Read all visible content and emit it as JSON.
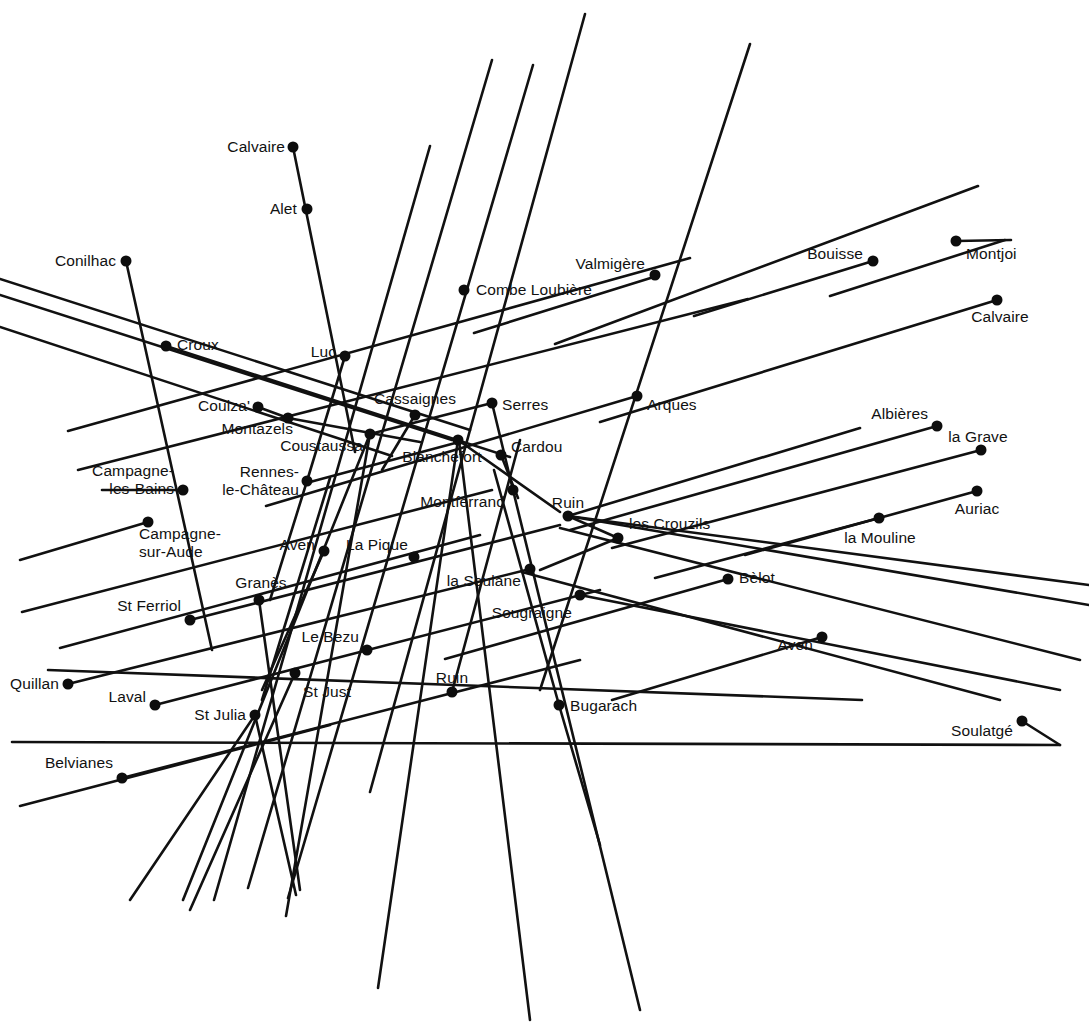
{
  "figure": {
    "type": "alignment-map",
    "width": 1089,
    "height": 1036,
    "background_color": "#ffffff",
    "line_color": "#111111",
    "dot_color": "#0d0d0d",
    "line_width": 2.6,
    "dot_radius": 5.5
  },
  "sites": [
    {
      "name": "Calvaire",
      "x": 293,
      "y": 147,
      "lx": 285,
      "ly": 147,
      "anchor": "r",
      "lines": [
        "Calvaire"
      ]
    },
    {
      "name": "Alet",
      "x": 307,
      "y": 209,
      "lx": 297,
      "ly": 209,
      "anchor": "r",
      "lines": [
        "Alet"
      ]
    },
    {
      "name": "Conilhac",
      "x": 126,
      "y": 261,
      "lx": 116,
      "ly": 261,
      "anchor": "r",
      "lines": [
        "Conilhac"
      ]
    },
    {
      "name": "Combe Loubiere",
      "x": 464,
      "y": 290,
      "lx": 476,
      "ly": 290,
      "anchor": "l",
      "lines": [
        "Combe Loubière"
      ]
    },
    {
      "name": "Valmigere",
      "x": 655,
      "y": 275,
      "lx": 645,
      "ly": 264,
      "anchor": "r",
      "lines": [
        "Valmigère"
      ]
    },
    {
      "name": "Bouisse",
      "x": 873,
      "y": 261,
      "lx": 863,
      "ly": 254,
      "anchor": "r",
      "lines": [
        "Bouisse"
      ]
    },
    {
      "name": "Montjoi",
      "x": 956,
      "y": 241,
      "lx": 966,
      "ly": 254,
      "anchor": "l",
      "lines": [
        "Montjoi"
      ]
    },
    {
      "name": "Calvaire-est",
      "x": 997,
      "y": 300,
      "lx": 1000,
      "ly": 317,
      "anchor": "c",
      "lines": [
        "Calvaire"
      ]
    },
    {
      "name": "Croux",
      "x": 166,
      "y": 346,
      "lx": 177,
      "ly": 345,
      "anchor": "l",
      "lines": [
        "Croux"
      ]
    },
    {
      "name": "Luc",
      "x": 345,
      "y": 356,
      "lx": 336,
      "ly": 352,
      "anchor": "r",
      "lines": [
        "Luc"
      ]
    },
    {
      "name": "Cassaignes",
      "x": 415,
      "y": 415,
      "lx": 415,
      "ly": 399,
      "anchor": "c",
      "lines": [
        "Cassaignes"
      ]
    },
    {
      "name": "Serres",
      "x": 492,
      "y": 403,
      "lx": 502,
      "ly": 405,
      "anchor": "l",
      "lines": [
        "Serres"
      ]
    },
    {
      "name": "Arques",
      "x": 637,
      "y": 396,
      "lx": 647,
      "ly": 405,
      "anchor": "l",
      "lines": [
        "Arques"
      ]
    },
    {
      "name": "Couiza",
      "x": 258,
      "y": 407,
      "lx": 250,
      "ly": 406,
      "anchor": "r",
      "lines": [
        "Couiza'"
      ]
    },
    {
      "name": "Montazels",
      "x": 288,
      "y": 418,
      "lx": 293,
      "ly": 429,
      "anchor": "r",
      "lines": [
        "Montazels"
      ]
    },
    {
      "name": "Coustaussa",
      "x": 370,
      "y": 434,
      "lx": 363,
      "ly": 446,
      "anchor": "r",
      "lines": [
        "Coustaussa"
      ]
    },
    {
      "name": "Blanchefort",
      "x": 458,
      "y": 440,
      "lx": 442,
      "ly": 457,
      "anchor": "c",
      "lines": [
        "Blanchefort"
      ]
    },
    {
      "name": "Cardou",
      "x": 501,
      "y": 455,
      "lx": 511,
      "ly": 447,
      "anchor": "l",
      "lines": [
        "Cardou"
      ]
    },
    {
      "name": "Albieres",
      "x": 937,
      "y": 426,
      "lx": 928,
      "ly": 414,
      "anchor": "r",
      "lines": [
        "Albières"
      ]
    },
    {
      "name": "la Grave",
      "x": 981,
      "y": 450,
      "lx": 978,
      "ly": 437,
      "anchor": "c",
      "lines": [
        "la Grave"
      ]
    },
    {
      "name": "Rennes-le-Chateau",
      "x": 307,
      "y": 481,
      "lx": 299,
      "ly": 481,
      "anchor": "r",
      "lines": [
        "Rennes-",
        "le-Château"
      ]
    },
    {
      "name": "Campagne-les-Bains",
      "x": 183,
      "y": 490,
      "lx": 174,
      "ly": 480,
      "anchor": "r",
      "lines": [
        "Campagne-",
        "les-Bains"
      ]
    },
    {
      "name": "Montferrand",
      "x": 513,
      "y": 490,
      "lx": 505,
      "ly": 502,
      "anchor": "r",
      "lines": [
        "Montferrand"
      ]
    },
    {
      "name": "Ruin-nord",
      "x": 568,
      "y": 516,
      "lx": 568,
      "ly": 503,
      "anchor": "c",
      "lines": [
        "Ruin"
      ]
    },
    {
      "name": "Auriac",
      "x": 977,
      "y": 491,
      "lx": 977,
      "ly": 509,
      "anchor": "c",
      "lines": [
        "Auriac"
      ]
    },
    {
      "name": "la Mouline",
      "x": 879,
      "y": 518,
      "lx": 880,
      "ly": 538,
      "anchor": "c",
      "lines": [
        "la Mouline"
      ]
    },
    {
      "name": "les Crouzils",
      "x": 618,
      "y": 538,
      "lx": 629,
      "ly": 524,
      "anchor": "l",
      "lines": [
        "les Crouzils"
      ]
    },
    {
      "name": "Campagne-sur-Aude",
      "x": 148,
      "y": 522,
      "lx": 139,
      "ly": 543,
      "anchor": "l",
      "lines": [
        "Campagne-",
        "sur-Aude"
      ]
    },
    {
      "name": "Aven-ouest",
      "x": 324,
      "y": 551,
      "lx": 315,
      "ly": 545,
      "anchor": "r",
      "lines": [
        "Aven"
      ]
    },
    {
      "name": "La Pique",
      "x": 414,
      "y": 557,
      "lx": 408,
      "ly": 545,
      "anchor": "r",
      "lines": [
        "La Pique"
      ]
    },
    {
      "name": "la Soulane",
      "x": 530,
      "y": 569,
      "lx": 521,
      "ly": 581,
      "anchor": "r",
      "lines": [
        "la Soulane"
      ]
    },
    {
      "name": "Belot",
      "x": 728,
      "y": 579,
      "lx": 739,
      "ly": 578,
      "anchor": "l",
      "lines": [
        "Bèlot"
      ]
    },
    {
      "name": "Sougraigne",
      "x": 580,
      "y": 595,
      "lx": 572,
      "ly": 613,
      "anchor": "r",
      "lines": [
        "Sougraigne"
      ]
    },
    {
      "name": "Granes",
      "x": 259,
      "y": 600,
      "lx": 261,
      "ly": 583,
      "anchor": "c",
      "lines": [
        "Granès"
      ]
    },
    {
      "name": "St Ferriol",
      "x": 190,
      "y": 620,
      "lx": 181,
      "ly": 606,
      "anchor": "r",
      "lines": [
        "St Ferriol"
      ]
    },
    {
      "name": "Le Bezu",
      "x": 367,
      "y": 650,
      "lx": 359,
      "ly": 637,
      "anchor": "r",
      "lines": [
        "Le Bezu"
      ]
    },
    {
      "name": "Aven-est",
      "x": 822,
      "y": 637,
      "lx": 813,
      "ly": 645,
      "anchor": "r",
      "lines": [
        "Aven"
      ]
    },
    {
      "name": "Quillan",
      "x": 68,
      "y": 684,
      "lx": 59,
      "ly": 684,
      "anchor": "r",
      "lines": [
        "Quillan"
      ]
    },
    {
      "name": "St Just",
      "x": 295,
      "y": 673,
      "lx": 303,
      "ly": 692,
      "anchor": "l",
      "lines": [
        "St Just"
      ]
    },
    {
      "name": "Ruin-sud",
      "x": 452,
      "y": 692,
      "lx": 452,
      "ly": 678,
      "anchor": "c",
      "lines": [
        "Ruin"
      ]
    },
    {
      "name": "Laval",
      "x": 155,
      "y": 705,
      "lx": 146,
      "ly": 697,
      "anchor": "r",
      "lines": [
        "Laval"
      ]
    },
    {
      "name": "St Julia",
      "x": 255,
      "y": 715,
      "lx": 246,
      "ly": 715,
      "anchor": "r",
      "lines": [
        "St Julia"
      ]
    },
    {
      "name": "Bugarach",
      "x": 559,
      "y": 705,
      "lx": 570,
      "ly": 706,
      "anchor": "l",
      "lines": [
        "Bugarach"
      ]
    },
    {
      "name": "Soulatge",
      "x": 1022,
      "y": 721,
      "lx": 1013,
      "ly": 731,
      "anchor": "r",
      "lines": [
        "Soulatgé"
      ]
    },
    {
      "name": "Belvianes",
      "x": 122,
      "y": 778,
      "lx": 113,
      "ly": 763,
      "anchor": "r",
      "lines": [
        "Belvianes"
      ]
    }
  ],
  "alignment_lines": [
    {
      "id": "L01",
      "x1": 293,
      "y1": 147,
      "x2": 355,
      "y2": 452
    },
    {
      "id": "L02",
      "x1": 126,
      "y1": 261,
      "x2": 212,
      "y2": 650
    },
    {
      "id": "L03",
      "x1": 0,
      "y1": 279,
      "x2": 470,
      "y2": 430
    },
    {
      "id": "L04",
      "x1": 0,
      "y1": 295,
      "x2": 452,
      "y2": 440
    },
    {
      "id": "L05",
      "x1": 0,
      "y1": 327,
      "x2": 392,
      "y2": 456
    },
    {
      "id": "L06",
      "x1": 68,
      "y1": 431,
      "x2": 690,
      "y2": 258
    },
    {
      "id": "L07",
      "x1": 78,
      "y1": 470,
      "x2": 748,
      "y2": 299
    },
    {
      "id": "L08",
      "x1": 166,
      "y1": 346,
      "x2": 510,
      "y2": 457
    },
    {
      "id": "L09",
      "x1": 430,
      "y1": 146,
      "x2": 214,
      "y2": 900
    },
    {
      "id": "L10",
      "x1": 492,
      "y1": 60,
      "x2": 248,
      "y2": 888
    },
    {
      "id": "L11",
      "x1": 533,
      "y1": 65,
      "x2": 288,
      "y2": 898
    },
    {
      "id": "L12",
      "x1": 585,
      "y1": 14,
      "x2": 370,
      "y2": 792
    },
    {
      "id": "L13",
      "x1": 750,
      "y1": 44,
      "x2": 540,
      "y2": 690
    },
    {
      "id": "L14",
      "x1": 978,
      "y1": 186,
      "x2": 555,
      "y2": 344
    },
    {
      "id": "L15",
      "x1": 1005,
      "y1": 240,
      "x2": 830,
      "y2": 296
    },
    {
      "id": "L16",
      "x1": 997,
      "y1": 300,
      "x2": 600,
      "y2": 422
    },
    {
      "id": "L17",
      "x1": 937,
      "y1": 426,
      "x2": 570,
      "y2": 530
    },
    {
      "id": "L18",
      "x1": 981,
      "y1": 450,
      "x2": 612,
      "y2": 548
    },
    {
      "id": "L19",
      "x1": 977,
      "y1": 491,
      "x2": 745,
      "y2": 555
    },
    {
      "id": "L20",
      "x1": 879,
      "y1": 518,
      "x2": 655,
      "y2": 578
    },
    {
      "id": "L21",
      "x1": 1011,
      "y1": 240,
      "x2": 956,
      "y2": 241
    },
    {
      "id": "L22",
      "x1": 873,
      "y1": 261,
      "x2": 694,
      "y2": 316
    },
    {
      "id": "L23",
      "x1": 657,
      "y1": 276,
      "x2": 474,
      "y2": 333
    },
    {
      "id": "L24",
      "x1": 637,
      "y1": 396,
      "x2": 266,
      "y2": 506
    },
    {
      "id": "L25",
      "x1": 728,
      "y1": 579,
      "x2": 445,
      "y2": 659
    },
    {
      "id": "L26",
      "x1": 822,
      "y1": 637,
      "x2": 612,
      "y2": 700
    },
    {
      "id": "L27",
      "x1": 1022,
      "y1": 721,
      "x2": 1060,
      "y2": 745
    },
    {
      "id": "L28",
      "x1": 48,
      "y1": 670,
      "x2": 862,
      "y2": 700
    },
    {
      "id": "L29",
      "x1": 12,
      "y1": 742,
      "x2": 1060,
      "y2": 745
    },
    {
      "id": "L30",
      "x1": 20,
      "y1": 806,
      "x2": 330,
      "y2": 725
    },
    {
      "id": "L31",
      "x1": 60,
      "y1": 648,
      "x2": 480,
      "y2": 535
    },
    {
      "id": "L32",
      "x1": 22,
      "y1": 612,
      "x2": 492,
      "y2": 490
    },
    {
      "id": "L33",
      "x1": 68,
      "y1": 684,
      "x2": 530,
      "y2": 569
    },
    {
      "id": "L34",
      "x1": 155,
      "y1": 705,
      "x2": 600,
      "y2": 590
    },
    {
      "id": "L35",
      "x1": 122,
      "y1": 778,
      "x2": 580,
      "y2": 660
    },
    {
      "id": "L36",
      "x1": 370,
      "y1": 434,
      "x2": 183,
      "y2": 900
    },
    {
      "id": "L37",
      "x1": 370,
      "y1": 434,
      "x2": 286,
      "y2": 916
    },
    {
      "id": "L38",
      "x1": 458,
      "y1": 440,
      "x2": 378,
      "y2": 988
    },
    {
      "id": "L39",
      "x1": 459,
      "y1": 441,
      "x2": 530,
      "y2": 1020
    },
    {
      "id": "L40",
      "x1": 513,
      "y1": 490,
      "x2": 640,
      "y2": 1010
    },
    {
      "id": "L41",
      "x1": 568,
      "y1": 516,
      "x2": 618,
      "y2": 538
    },
    {
      "id": "L42",
      "x1": 559,
      "y1": 705,
      "x2": 600,
      "y2": 845
    },
    {
      "id": "L43",
      "x1": 452,
      "y1": 692,
      "x2": 452,
      "y2": 692
    },
    {
      "id": "L44",
      "x1": 190,
      "y1": 620,
      "x2": 560,
      "y2": 525
    },
    {
      "id": "L45",
      "x1": 148,
      "y1": 522,
      "x2": 20,
      "y2": 560
    },
    {
      "id": "L46",
      "x1": 183,
      "y1": 490,
      "x2": 102,
      "y2": 490
    },
    {
      "id": "L47",
      "x1": 307,
      "y1": 481,
      "x2": 345,
      "y2": 356
    },
    {
      "id": "L48",
      "x1": 307,
      "y1": 481,
      "x2": 270,
      "y2": 600
    },
    {
      "id": "L49",
      "x1": 324,
      "y1": 551,
      "x2": 262,
      "y2": 690
    },
    {
      "id": "L50",
      "x1": 415,
      "y1": 415,
      "x2": 382,
      "y2": 470
    },
    {
      "id": "L51",
      "x1": 492,
      "y1": 403,
      "x2": 513,
      "y2": 490
    },
    {
      "id": "L52",
      "x1": 501,
      "y1": 455,
      "x2": 518,
      "y2": 498
    },
    {
      "id": "L53",
      "x1": 258,
      "y1": 407,
      "x2": 288,
      "y2": 418
    },
    {
      "id": "L54",
      "x1": 288,
      "y1": 418,
      "x2": 420,
      "y2": 442
    },
    {
      "id": "L55",
      "x1": 458,
      "y1": 440,
      "x2": 560,
      "y2": 512
    },
    {
      "id": "L56",
      "x1": 568,
      "y1": 516,
      "x2": 860,
      "y2": 428
    },
    {
      "id": "L57",
      "x1": 618,
      "y1": 538,
      "x2": 540,
      "y2": 570
    },
    {
      "id": "L58",
      "x1": 370,
      "y1": 434,
      "x2": 492,
      "y2": 403
    },
    {
      "id": "L59",
      "x1": 459,
      "y1": 442,
      "x2": 310,
      "y2": 482
    },
    {
      "id": "L60",
      "x1": 255,
      "y1": 715,
      "x2": 130,
      "y2": 900
    },
    {
      "id": "L61",
      "x1": 255,
      "y1": 715,
      "x2": 296,
      "y2": 895
    },
    {
      "id": "L62",
      "x1": 295,
      "y1": 673,
      "x2": 190,
      "y2": 910
    },
    {
      "id": "L63",
      "x1": 259,
      "y1": 600,
      "x2": 300,
      "y2": 890
    },
    {
      "id": "L64",
      "x1": 330,
      "y1": 478,
      "x2": 262,
      "y2": 700
    },
    {
      "id": "L65",
      "x1": 580,
      "y1": 595,
      "x2": 1060,
      "y2": 690
    },
    {
      "id": "L66",
      "x1": 522,
      "y1": 572,
      "x2": 1000,
      "y2": 700
    },
    {
      "id": "L67",
      "x1": 560,
      "y1": 528,
      "x2": 1080,
      "y2": 660
    },
    {
      "id": "L68",
      "x1": 568,
      "y1": 516,
      "x2": 1089,
      "y2": 605
    },
    {
      "id": "L69",
      "x1": 1089,
      "y1": 585,
      "x2": 568,
      "y2": 516
    },
    {
      "id": "L70",
      "x1": 452,
      "y1": 692,
      "x2": 520,
      "y2": 440
    },
    {
      "id": "L71",
      "x1": 559,
      "y1": 705,
      "x2": 494,
      "y2": 470
    }
  ]
}
